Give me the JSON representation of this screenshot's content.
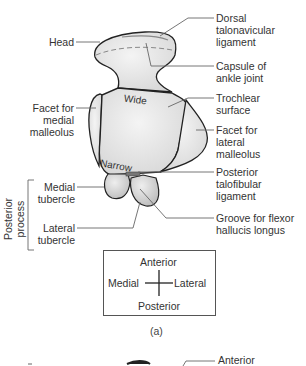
{
  "figure": {
    "caption": "(a)",
    "surface_labels": {
      "wide": "Wide",
      "narrow": "Narrow"
    },
    "left_labels": {
      "head": "Head",
      "facet_medial_1": "Facet for",
      "facet_medial_2": "medial",
      "facet_medial_3": "malleolus",
      "medial_tubercle_1": "Medial",
      "medial_tubercle_2": "tubercle",
      "lateral_tubercle_1": "Lateral",
      "lateral_tubercle_2": "tubercle",
      "posterior_process_1": "Posterior",
      "posterior_process_2": "process"
    },
    "right_labels": {
      "dorsal_1": "Dorsal",
      "dorsal_2": "talonavicular",
      "dorsal_3": "ligament",
      "capsule_1": "Capsule of",
      "capsule_2": "ankle joint",
      "trochlear_1": "Trochlear",
      "trochlear_2": "surface",
      "facet_lateral_1": "Facet for",
      "facet_lateral_2": "lateral",
      "facet_lateral_3": "malleolus",
      "ptfl_1": "Posterior",
      "ptfl_2": "talofibular",
      "ptfl_3": "ligament",
      "groove_1": "Groove for flexor",
      "groove_2": "hallucis longus"
    },
    "orientation": {
      "anterior": "Anterior",
      "posterior": "Posterior",
      "medial": "Medial",
      "lateral": "Lateral"
    },
    "next_panel_partial": {
      "right_label": "Anterior"
    },
    "colors": {
      "bone_fill": "#e4e4e4",
      "bone_highlight": "#f2f2f2",
      "outline": "#222222",
      "leader": "#555555",
      "ligament": "#888888"
    }
  }
}
